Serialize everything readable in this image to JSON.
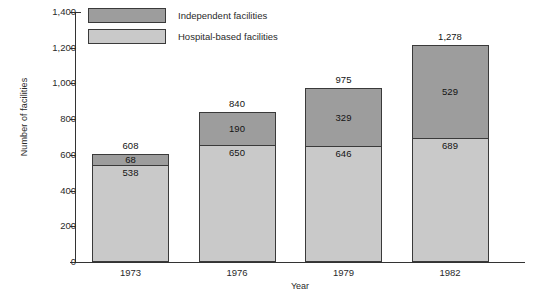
{
  "chart_data": {
    "type": "bar",
    "subtype": "stacked",
    "title": "",
    "xlabel": "Year",
    "ylabel": "Number of facilities",
    "categories": [
      "1973",
      "1976",
      "1979",
      "1982"
    ],
    "ylim": [
      0,
      1400
    ],
    "yticks": [
      "0",
      "200",
      "400",
      "600",
      "800",
      "1,000",
      "1,200",
      "1,400"
    ],
    "ytick_values": [
      0,
      200,
      400,
      600,
      800,
      1000,
      1200,
      1400
    ],
    "grid": false,
    "legend_position": "top-left-inside",
    "series": [
      {
        "name": "Hospital-based facilities",
        "color": "#c9c9c9",
        "values": [
          538,
          650,
          646,
          689
        ],
        "labels": [
          "538",
          "650",
          "646",
          "689"
        ]
      },
      {
        "name": "Independent facilities",
        "color": "#9d9d9d",
        "values": [
          68,
          190,
          329,
          529
        ],
        "labels": [
          "68",
          "190",
          "329",
          "529"
        ]
      }
    ],
    "totals": [
      608,
      840,
      975,
      1278
    ],
    "total_labels": [
      "608",
      "840",
      "975",
      "1,278"
    ]
  },
  "legend": {
    "items": [
      {
        "label": "Independent facilities",
        "swatch": "independent"
      },
      {
        "label": "Hospital-based facilities",
        "swatch": "hospital"
      }
    ]
  },
  "axes": {
    "y_title": "Number of facilities",
    "x_title": "Year"
  }
}
